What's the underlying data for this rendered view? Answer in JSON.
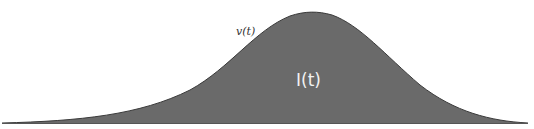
{
  "diagram": {
    "type": "bell-curve-area",
    "curve_label": "v(t)",
    "area_label": "I(t)",
    "colors": {
      "fill": "#6a6a6a",
      "outline": "#3a3a3a",
      "baseline": "#555555",
      "background": "#ffffff",
      "curve_label": "#333333",
      "area_label": "#f2f2f2"
    },
    "geometry": {
      "baseline_y": 123,
      "x_start": 2,
      "x_end": 528,
      "peak_x": 310,
      "peak_y": 13
    }
  }
}
